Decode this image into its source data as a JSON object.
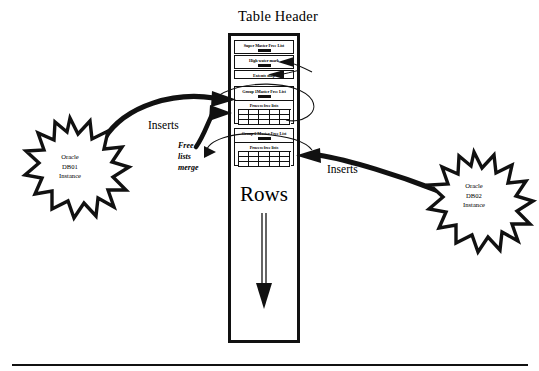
{
  "diagram": {
    "title": "Table Header",
    "column": {
      "rows_label": "Rows",
      "rows_arrow_icon": "down-arrow-icon"
    },
    "blocks": [
      {
        "id": "super-master-free-list",
        "label": "Super Master Free List",
        "has_bar": true
      },
      {
        "id": "high-water-mark",
        "label": "High water mark",
        "has_bar": true
      },
      {
        "id": "extents-map",
        "label": "Extents map",
        "has_bar": false
      },
      {
        "id": "group-1-master-free-list",
        "label": "Group 1Master Free List",
        "sub_label": "Process free lists",
        "has_bar": true,
        "grid_columns": 5,
        "grid_rows": 3
      },
      {
        "id": "group-2-master-free-list",
        "label": "Group 2 Master Free List",
        "sub_label": "Process free lists",
        "has_bar": true,
        "grid_columns": 5,
        "grid_rows": 3
      }
    ],
    "annotations": {
      "inserts_left": "Inserts",
      "inserts_right": "Inserts",
      "free_lists_merge_line1": "Free",
      "free_lists_merge_line2": "lists",
      "free_lists_merge_line3": "merge"
    },
    "instances": [
      {
        "id": "oracle-db01",
        "line1": "Oracle",
        "line2": "DB01",
        "line3": "Instance"
      },
      {
        "id": "oracle-db02",
        "line1": "Oracle",
        "line2": "DB02",
        "line3": "Instance"
      }
    ],
    "colors": {
      "ink": "#111111",
      "background": "#ffffff"
    }
  }
}
